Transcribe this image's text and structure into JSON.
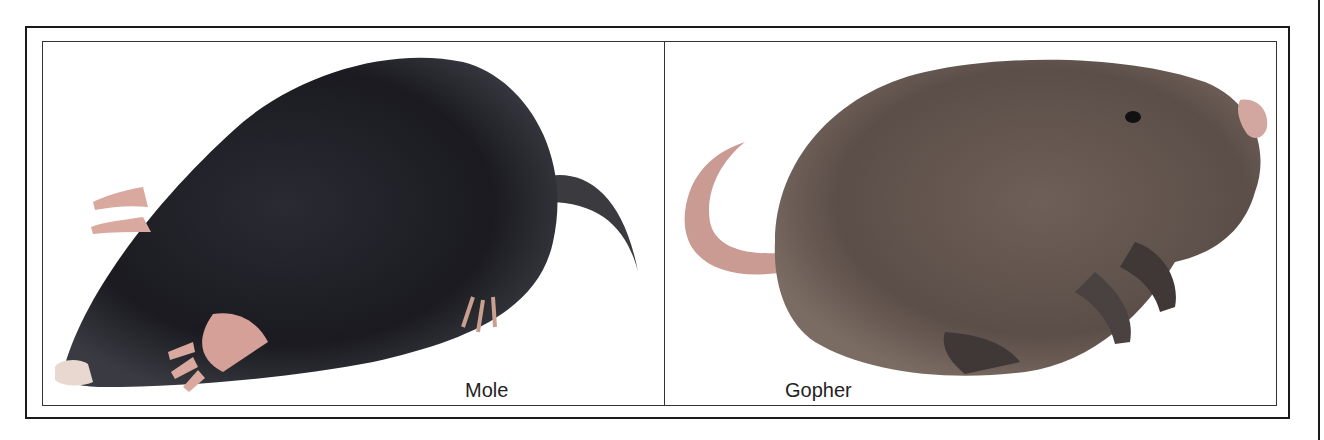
{
  "figure": {
    "panels": [
      {
        "label": "Mole",
        "subject": "mole-illustration",
        "fur_color": "#1c1c22",
        "skin_color": "#d9a9a0"
      },
      {
        "label": "Gopher",
        "subject": "gopher-illustration",
        "fur_color": "#6b5d56",
        "skin_color": "#c99b92"
      }
    ]
  }
}
